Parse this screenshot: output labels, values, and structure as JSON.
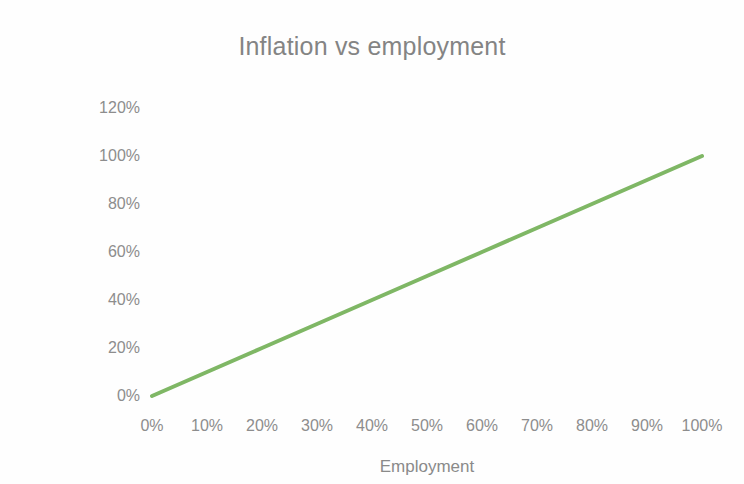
{
  "chart_data": {
    "type": "line",
    "title": "Inflation vs employment",
    "xlabel": "Employment",
    "ylabel": "Inflation factor",
    "x": [
      0,
      10,
      20,
      30,
      40,
      50,
      60,
      70,
      80,
      90,
      100
    ],
    "series": [
      {
        "name": "Inflation factor",
        "values": [
          0,
          10,
          20,
          30,
          40,
          50,
          60,
          70,
          80,
          90,
          100
        ],
        "color": "#7fb765"
      }
    ],
    "xlim": [
      0,
      100
    ],
    "ylim": [
      0,
      120
    ],
    "x_tick_labels": [
      "0%",
      "10%",
      "20%",
      "30%",
      "40%",
      "50%",
      "60%",
      "70%",
      "80%",
      "90%",
      "100%"
    ],
    "x_tick_values": [
      0,
      10,
      20,
      30,
      40,
      50,
      60,
      70,
      80,
      90,
      100
    ],
    "y_tick_labels": [
      "0%",
      "20%",
      "40%",
      "60%",
      "80%",
      "100%",
      "120%"
    ],
    "y_tick_values": [
      0,
      20,
      40,
      60,
      80,
      100,
      120
    ],
    "grid": false,
    "legend": false,
    "line_width": 4,
    "colors": {
      "line": "#7fb765",
      "text": "#8a8a8a",
      "title": "#848484",
      "background": "#fefefe"
    }
  }
}
